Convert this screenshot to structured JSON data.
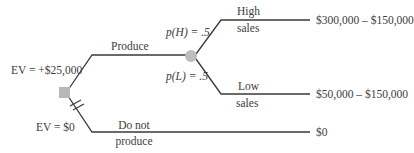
{
  "diagram": {
    "type": "decision-tree",
    "colors": {
      "line": "#3a3a3a",
      "decision_node": "#b8b8b8",
      "chance_node": "#bdbdbd",
      "text": "#3c3c3c"
    },
    "decision_node": {
      "ev_top": "EV = +$25,000",
      "ev_bottom": "EV = $0"
    },
    "branches": {
      "produce": {
        "label": "Produce"
      },
      "do_not_produce": {
        "label_line1": "Do not",
        "label_line2": "produce",
        "payoff": "$0"
      }
    },
    "chance_node": {
      "high": {
        "probability": "p(H) = .5",
        "label_line1": "High",
        "label_line2": "sales",
        "payoff": "$300,000 – $150,000"
      },
      "low": {
        "probability": "p(L) = .5",
        "label_line1": "Low",
        "label_line2": "sales",
        "payoff": "$50,000 – $150,000"
      }
    }
  }
}
